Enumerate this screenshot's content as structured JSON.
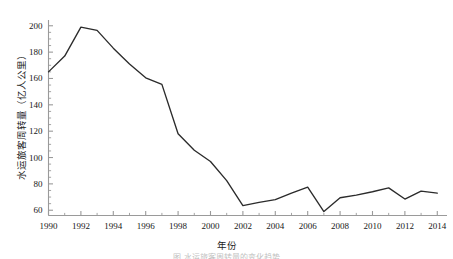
{
  "chart_data": {
    "type": "line",
    "title": "",
    "xlabel": "年份",
    "ylabel": "水运旅客周转量（亿人公里）",
    "x": [
      1990,
      1991,
      1992,
      1993,
      1994,
      1995,
      1996,
      1997,
      1998,
      1999,
      2000,
      2001,
      2002,
      2003,
      2004,
      2005,
      2006,
      2007,
      2008,
      2009,
      2010,
      2011,
      2012,
      2013,
      2014
    ],
    "values": [
      165.0,
      177.0,
      199.0,
      196.5,
      183.0,
      171.0,
      160.5,
      155.5,
      118.0,
      105.5,
      97.0,
      82.5,
      63.5,
      66.0,
      68.0,
      73.0,
      77.5,
      59.0,
      69.5,
      71.5,
      74.0,
      77.0,
      68.5,
      74.5,
      73.0
    ],
    "series": [
      {
        "name": "水运旅客周转量",
        "values": [
          165.0,
          177.0,
          199.0,
          196.5,
          183.0,
          171.0,
          160.5,
          155.5,
          118.0,
          105.5,
          97.0,
          82.5,
          63.5,
          66.0,
          68.0,
          73.0,
          77.5,
          59.0,
          69.5,
          71.5,
          74.0,
          77.0,
          68.5,
          74.5,
          73.0
        ]
      }
    ],
    "xlim": [
      1990,
      2014.6
    ],
    "ylim": [
      56,
      204
    ],
    "xticks": [
      1990,
      1992,
      1994,
      1996,
      1998,
      2000,
      2002,
      2004,
      2006,
      2008,
      2010,
      2012,
      2014
    ],
    "xtick_labels": [
      "1990",
      "1992",
      "1994",
      "1996",
      "1998",
      "2000",
      "2002",
      "2004",
      "2006",
      "2008",
      "2010",
      "2012",
      "2014"
    ],
    "yticks": [
      60,
      80,
      100,
      120,
      140,
      160,
      180,
      200
    ],
    "ytick_labels": [
      "60",
      "80",
      "100",
      "120",
      "140",
      "160",
      "180",
      "200"
    ],
    "y_minor_step": 5,
    "x_minor_step": 1,
    "grid": false,
    "legend": "none",
    "line_color": "#2b2b2b",
    "axis_color": "#9a9a9a",
    "text_color": "#1c1c1c",
    "background": "#ffffff"
  },
  "caption": {
    "text": "图 水运旅客周转量的变化趋势"
  }
}
